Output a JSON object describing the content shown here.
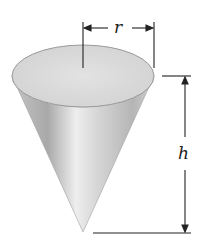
{
  "figure": {
    "type": "cone-diagram",
    "labels": {
      "radius": "r",
      "height": "h"
    },
    "colors": {
      "cone_light": "#f2f2f2",
      "cone_mid": "#bdbdbd",
      "cone_dark": "#9a9a9a",
      "top_face": "#dcdcdc",
      "line": "#333333"
    }
  }
}
